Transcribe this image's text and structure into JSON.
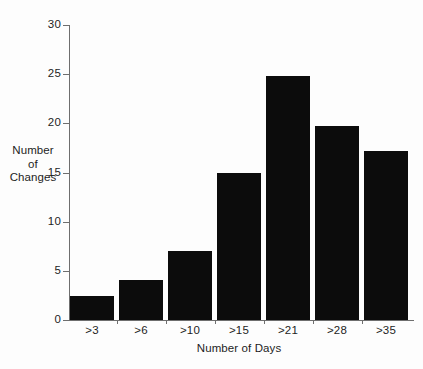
{
  "chart_data": {
    "type": "bar",
    "title": "",
    "subtitle": "",
    "xlabel": "Number of Days",
    "ylabel": "Number of Changes",
    "ylabel_lines": [
      "Number",
      "of",
      "Changes"
    ],
    "categories": [
      ">3",
      ">6",
      ">10",
      ">15",
      ">21",
      ">28",
      ">35"
    ],
    "values": [
      2.4,
      4.1,
      7.0,
      14.9,
      24.8,
      19.7,
      17.2
    ],
    "ylim": [
      0,
      30
    ],
    "xlim_note": "categorical",
    "yticks": [
      0,
      5,
      10,
      15,
      20,
      25,
      30
    ],
    "ytick_labels": [
      "0",
      "5",
      "10",
      "15",
      "20",
      "25",
      "30"
    ],
    "grid": false,
    "legend": false,
    "legend_position": "none",
    "bar_color": "#0c0c0c",
    "axis_color": "#6e6e6e",
    "background_color": "#fdfdfd",
    "orientation": "vertical",
    "annotations": []
  },
  "figure": {
    "caption": ""
  }
}
